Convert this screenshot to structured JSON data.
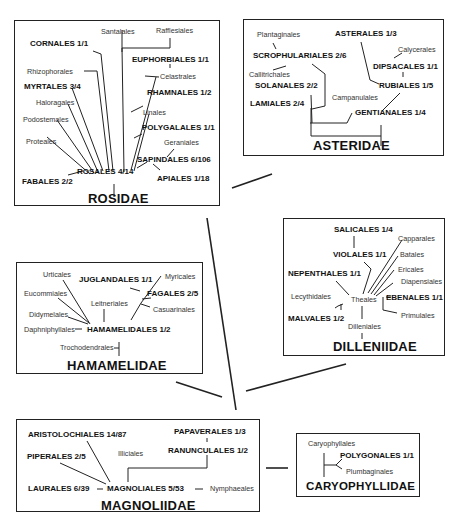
{
  "diagram": {
    "type": "phylogenetic-relationship-diagram",
    "subclasses": {
      "rosidae": {
        "title": "ROSIDAE",
        "orders": {
          "santalales": "Santalales",
          "rafflesiales": "Rafflesiales",
          "cornales": "CORNALES 1/1",
          "euphorbiales": "EUPHORBIALES 1/1",
          "rhizophorales": "Rhizophorales",
          "celastrales": "Celastrales",
          "myrtales": "MYRTALES 3/4",
          "rhamnales": "RHAMNALES 1/2",
          "haloragales": "Haloragales",
          "linales": "Linales",
          "podostemales": "Podostemales",
          "polygalales": "POLYGALALES 1/1",
          "proteales": "Proteales",
          "geraniales": "Geraniales",
          "sapindales": "SAPINDALES 6/106",
          "rosales": "ROSALES 4/14",
          "fabales": "FABALES 2/2",
          "apiales": "APIALES 1/18"
        }
      },
      "asteridae": {
        "title": "ASTERIDAE",
        "orders": {
          "plantaginales": "Plantaginales",
          "asterales": "ASTERALES 1/3",
          "scrophulariales": "SCROPHULARIALES 2/6",
          "calycerales": "Calycerales",
          "callitrichales": "Callitrichales",
          "dipsacales": "DIPSACALES 1/1",
          "solanales": "SOLANALES 2/2",
          "rubiales": "RUBIALES 1/5",
          "campanulales": "Campanulales",
          "lamiales": "LAMIALES 2/4",
          "gentianales": "GENTIANALES 1/4"
        }
      },
      "hamamelidae": {
        "title": "HAMAMELIDAE",
        "orders": {
          "urticales": "Urticales",
          "juglandales": "JUGLANDALES 1/1",
          "myricales": "Myricales",
          "eucommiales": "Eucommiales",
          "fagales": "FAGALES 2/5",
          "leitneriales": "Leitneriales",
          "casuarinales": "Casuarinales",
          "didymelales": "Didymelales",
          "daphniphyllales": "Daphniphyllales",
          "hamamelidales": "HAMAMELIDALES 1/2",
          "trochodendrales": "Trochodendrales"
        }
      },
      "dilleniidae": {
        "title": "DILLENIIDAE",
        "orders": {
          "salicales": "SALICALES 1/4",
          "capparales": "Capparales",
          "violales": "VIOLALES 1/1",
          "batales": "Batales",
          "ericales": "Ericales",
          "nepenthales": "NEPENTHALES 1/1",
          "diapensiales": "Diapensiales",
          "lecythidales": "Lecythidales",
          "theales": "Theales",
          "ebenales": "EBENALES 1/1",
          "malvales": "MALVALES 1/2",
          "primulales": "Primulales",
          "dilleniales": "Dilleniales"
        }
      },
      "magnoliidae": {
        "title": "MAGNOLIIDAE",
        "orders": {
          "aristolochiales": "ARISTOLOCHIALES 14/87",
          "papaverales": "PAPAVERALES 1/3",
          "piperales": "PIPERALES 2/5",
          "illiciales": "Illiciales",
          "ranunculales": "RANUNCULALES 1/2",
          "laurales": "LAURALES 6/39",
          "magnoliales": "MAGNOLIALES 5/53",
          "nymphaeales": "Nymphaeales"
        }
      },
      "caryophyllidae": {
        "title": "CARYOPHYLLIDAE",
        "orders": {
          "caryophyllales": "Caryophyllales",
          "polygonales": "POLYGONALES 1/1",
          "plumbaginales": "Plumbaginales"
        }
      }
    },
    "colors": {
      "line": "#222222",
      "background": "#ffffff",
      "text": "#111111"
    }
  }
}
